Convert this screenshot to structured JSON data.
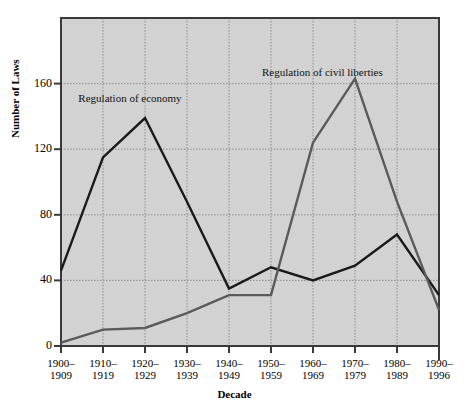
{
  "chart_data": {
    "type": "line",
    "title": "",
    "xlabel": "Decade",
    "ylabel": "Number of Laws",
    "categories": [
      "1900–1909",
      "1910–1919",
      "1920–1929",
      "1930–1939",
      "1940–1949",
      "1950–1959",
      "1960–1969",
      "1970–1979",
      "1980–1989",
      "1990–1996"
    ],
    "ylim": [
      0,
      200
    ],
    "yticks": [
      0,
      40,
      80,
      120,
      160
    ],
    "ytick_labels": [
      "0",
      "40",
      "80",
      "120",
      "160"
    ],
    "grid": true,
    "legend_position": "inline-annotations",
    "series": [
      {
        "name": "Regulation of economy",
        "color": "#1a1a1a",
        "values": [
          46,
          115,
          139,
          88,
          35,
          48,
          40,
          49,
          68,
          31
        ]
      },
      {
        "name": "Regulation of civil liberties",
        "color": "#5a5a5a",
        "values": [
          2,
          10,
          11,
          20,
          31,
          31,
          124,
          163,
          88,
          22
        ]
      }
    ],
    "annotations": [
      {
        "text_line1": "Regulation of",
        "text_line2": "economy",
        "series": "Regulation of economy"
      },
      {
        "text_line1": "Regulation of",
        "text_line2": "civil liberties",
        "series": "Regulation of civil liberties"
      }
    ]
  },
  "axis": {
    "y_title": "Number of Laws",
    "x_title": "Decade"
  },
  "colors": {
    "plot_background": "#d2d2d2",
    "grid": "#8c8c8c",
    "frame": "#3a3a3a",
    "economy_line": "#1a1a1a",
    "civil_liberties_line": "#5a5a5a",
    "text": "#000000"
  }
}
